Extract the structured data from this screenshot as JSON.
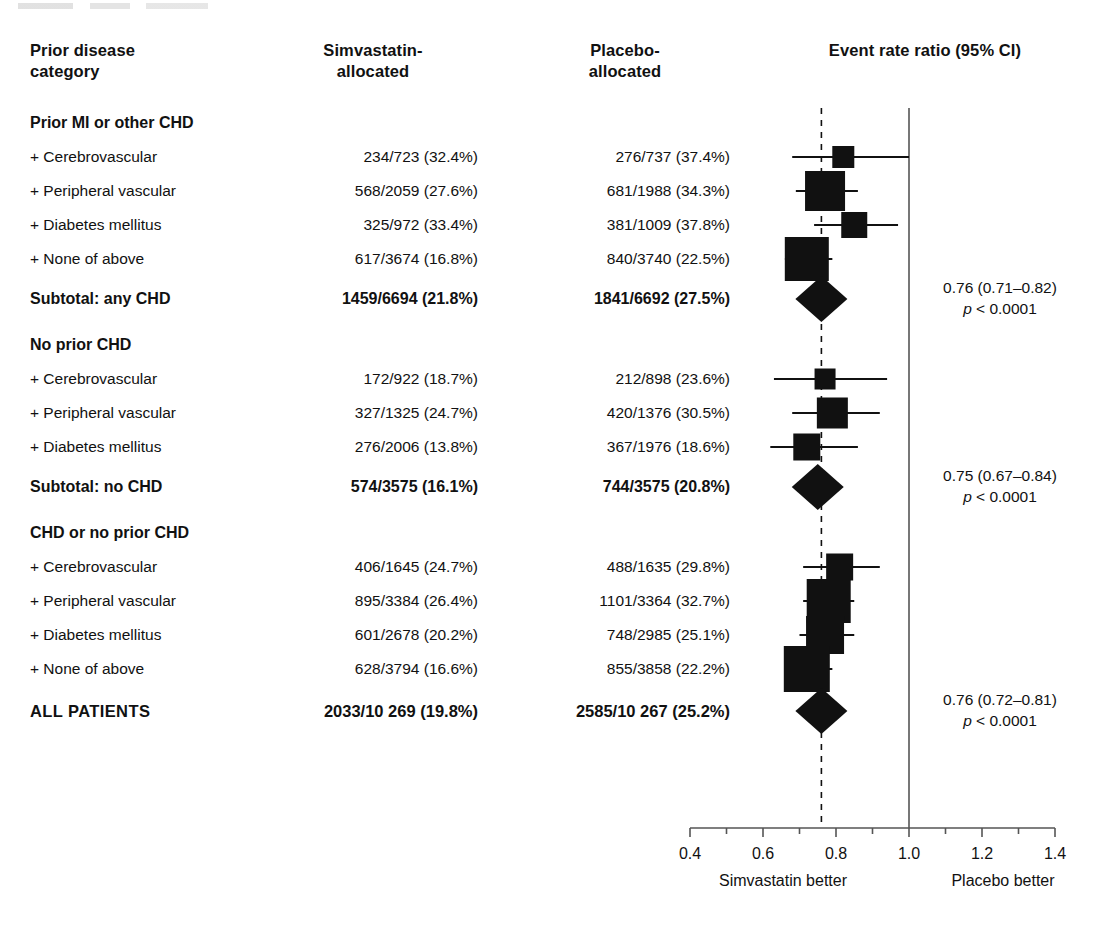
{
  "header": {
    "category": "Prior disease\ncategory",
    "category_line1": "Prior disease",
    "category_line2": "category",
    "simvastatin_line1": "Simvastatin-",
    "simvastatin_line2": "allocated",
    "placebo_line1": "Placebo-",
    "placebo_line2": "allocated",
    "plot_title": "Event rate ratio (95% CI)"
  },
  "rows": [
    {
      "type": "group",
      "label": "Prior MI or other CHD",
      "simvastatin": "",
      "placebo": ""
    },
    {
      "type": "item",
      "label": "+ Cerebrovascular",
      "simvastatin": "234/723 (32.4%)",
      "placebo": "276/737 (37.4%)"
    },
    {
      "type": "item",
      "label": "+ Peripheral vascular",
      "simvastatin": "568/2059 (27.6%)",
      "placebo": "681/1988 (34.3%)"
    },
    {
      "type": "item",
      "label": "+ Diabetes mellitus",
      "simvastatin": "325/972 (33.4%)",
      "placebo": "381/1009 (37.8%)"
    },
    {
      "type": "item",
      "label": "+ None of above",
      "simvastatin": "617/3674 (16.8%)",
      "placebo": "840/3740 (22.5%)"
    },
    {
      "type": "subtotal",
      "label": "Subtotal: any CHD",
      "simvastatin": "1459/6694 (21.8%)",
      "placebo": "1841/6692 (27.5%)"
    },
    {
      "type": "group",
      "label": "No prior CHD",
      "simvastatin": "",
      "placebo": ""
    },
    {
      "type": "item",
      "label": "+ Cerebrovascular",
      "simvastatin": "172/922 (18.7%)",
      "placebo": "212/898 (23.6%)"
    },
    {
      "type": "item",
      "label": "+ Peripheral vascular",
      "simvastatin": "327/1325 (24.7%)",
      "placebo": "420/1376 (30.5%)"
    },
    {
      "type": "item",
      "label": "+ Diabetes mellitus",
      "simvastatin": "276/2006 (13.8%)",
      "placebo": "367/1976 (18.6%)"
    },
    {
      "type": "subtotal",
      "label": "Subtotal: no CHD",
      "simvastatin": "574/3575 (16.1%)",
      "placebo": "744/3575 (20.8%)"
    },
    {
      "type": "group",
      "label": "CHD or no prior CHD",
      "simvastatin": "",
      "placebo": ""
    },
    {
      "type": "item",
      "label": "+ Cerebrovascular",
      "simvastatin": "406/1645 (24.7%)",
      "placebo": "488/1635 (29.8%)"
    },
    {
      "type": "item",
      "label": "+ Peripheral vascular",
      "simvastatin": "895/3384 (26.4%)",
      "placebo": "1101/3364 (32.7%)"
    },
    {
      "type": "item",
      "label": "+ Diabetes mellitus",
      "simvastatin": "601/2678 (20.2%)",
      "placebo": "748/2985 (25.1%)"
    },
    {
      "type": "item",
      "label": "+ None of above",
      "simvastatin": "628/3794 (16.6%)",
      "placebo": "855/3858 (22.2%)"
    },
    {
      "type": "total",
      "label": "ALL PATIENTS",
      "simvastatin": "2033/10 269 (19.8%)",
      "placebo": "2585/10 267 (25.2%)"
    }
  ],
  "annotations": [
    {
      "ratio": "0.76 (0.71–0.82)",
      "p_prefix": "p",
      "p_value": "< 0.0001",
      "row_index": 5
    },
    {
      "ratio": "0.75 (0.67–0.84)",
      "p_prefix": "p",
      "p_value": "< 0.0001",
      "row_index": 10
    },
    {
      "ratio": "0.76 (0.72–0.81)",
      "p_prefix": "p",
      "p_value": "< 0.0001",
      "row_index": 16
    }
  ],
  "axis": {
    "tick_labels": [
      "0.4",
      "0.6",
      "0.8",
      "1.0",
      "1.2",
      "1.4"
    ],
    "tick_values": [
      0.4,
      0.6,
      0.8,
      1.0,
      1.2,
      1.4
    ],
    "minor_step": 0.1,
    "min": 0.4,
    "max": 1.4,
    "null_value": 1.0,
    "reference_value": 0.76,
    "left_footer": "Simvastatin better",
    "right_footer": "Placebo better"
  },
  "chart_data": {
    "type": "forest",
    "title": "Event rate ratio (95% CI)",
    "xlabel": "",
    "ylabel": "",
    "xlim": [
      0.4,
      1.4
    ],
    "grid": false,
    "legend": "none",
    "null_line": 1.0,
    "reference_line": 0.76,
    "marker_types": {
      "item": "square",
      "subtotal": "diamond",
      "total": "diamond"
    },
    "points": [
      {
        "label": "Prior MI or other CHD: + Cerebrovascular",
        "row_index": 1,
        "marker": "square",
        "ratio": 0.82,
        "ci_low": 0.68,
        "ci_high": 1.0,
        "size": 22
      },
      {
        "label": "Prior MI or other CHD: + Peripheral vascular",
        "row_index": 2,
        "marker": "square",
        "ratio": 0.77,
        "ci_low": 0.69,
        "ci_high": 0.86,
        "size": 40
      },
      {
        "label": "Prior MI or other CHD: + Diabetes mellitus",
        "row_index": 3,
        "marker": "square",
        "ratio": 0.85,
        "ci_low": 0.74,
        "ci_high": 0.97,
        "size": 26
      },
      {
        "label": "Prior MI or other CHD: + None of above",
        "row_index": 4,
        "marker": "square",
        "ratio": 0.72,
        "ci_low": 0.66,
        "ci_high": 0.79,
        "size": 44
      },
      {
        "label": "Subtotal: any CHD",
        "row_index": 5,
        "marker": "diamond",
        "ratio": 0.76,
        "ci_low": 0.71,
        "ci_high": 0.82,
        "size": 0
      },
      {
        "label": "No prior CHD: + Cerebrovascular",
        "row_index": 7,
        "marker": "square",
        "ratio": 0.77,
        "ci_low": 0.63,
        "ci_high": 0.94,
        "size": 21
      },
      {
        "label": "No prior CHD: + Peripheral vascular",
        "row_index": 8,
        "marker": "square",
        "ratio": 0.79,
        "ci_low": 0.68,
        "ci_high": 0.92,
        "size": 31
      },
      {
        "label": "No prior CHD: + Diabetes mellitus",
        "row_index": 9,
        "marker": "square",
        "ratio": 0.72,
        "ci_low": 0.62,
        "ci_high": 0.86,
        "size": 27
      },
      {
        "label": "Subtotal: no CHD",
        "row_index": 10,
        "marker": "diamond",
        "ratio": 0.75,
        "ci_low": 0.67,
        "ci_high": 0.84,
        "size": 0
      },
      {
        "label": "CHD or no prior CHD: + Cerebrovascular",
        "row_index": 12,
        "marker": "square",
        "ratio": 0.81,
        "ci_low": 0.71,
        "ci_high": 0.92,
        "size": 27
      },
      {
        "label": "CHD or no prior CHD: + Peripheral vascular",
        "row_index": 13,
        "marker": "square",
        "ratio": 0.78,
        "ci_low": 0.71,
        "ci_high": 0.85,
        "size": 44
      },
      {
        "label": "CHD or no prior CHD: + Diabetes mellitus",
        "row_index": 14,
        "marker": "square",
        "ratio": 0.77,
        "ci_low": 0.7,
        "ci_high": 0.85,
        "size": 38
      },
      {
        "label": "CHD or no prior CHD: + None of above",
        "row_index": 15,
        "marker": "square",
        "ratio": 0.72,
        "ci_low": 0.66,
        "ci_high": 0.79,
        "size": 46
      },
      {
        "label": "ALL PATIENTS",
        "row_index": 16,
        "marker": "diamond",
        "ratio": 0.76,
        "ci_low": 0.72,
        "ci_high": 0.81,
        "size": 0
      }
    ]
  },
  "colors": {
    "marker": "#111111",
    "rule": "#555555",
    "text": "#111111"
  },
  "layout": {
    "row_top_start": 112,
    "row_height": 22,
    "row_tops": [
      112,
      146,
      180,
      214,
      248,
      288,
      334,
      368,
      402,
      436,
      476,
      522,
      556,
      590,
      624,
      658,
      700
    ],
    "axis_left_px": 690,
    "axis_right_px": 1055,
    "axis_y_px": 828
  }
}
